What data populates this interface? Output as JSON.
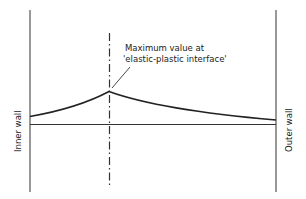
{
  "diagram": {
    "type": "profile-across-wall",
    "annotation": {
      "line1": "Maximum value at",
      "line2": "'elastic-plastic interface'"
    },
    "labels": {
      "inner_wall": "Inner wall",
      "outer_wall": "Outer wall"
    },
    "colors": {
      "line": "#222222",
      "background": "#ffffff"
    }
  }
}
